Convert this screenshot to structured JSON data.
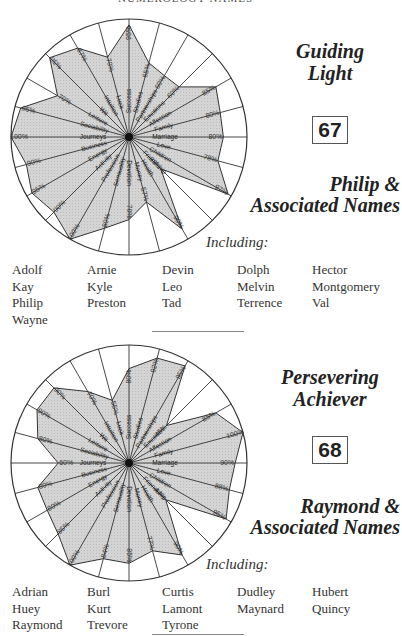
{
  "page": {
    "cropped_header": "NUMEROLOGY NAMES"
  },
  "sections": [
    {
      "title_line1": "Guiding",
      "title_line2": "Light",
      "number": "67",
      "name_line1": "Philip &",
      "name_line2": "Associated Names",
      "including_label": "Including:",
      "names": [
        "Adolf",
        "Arnie",
        "Devin",
        "Dolph",
        "Hector",
        "Kay",
        "Kyle",
        "Leo",
        "Melvin",
        "Montgomery",
        "Philip",
        "Preston",
        "Tad",
        "Terrence",
        "Val",
        "Wayne"
      ]
    },
    {
      "title_line1": "Persevering",
      "title_line2": "Achiever",
      "number": "68",
      "name_line1": "Raymond &",
      "name_line2": "Associated Names",
      "including_label": "Including:",
      "names": [
        "Adrian",
        "Burl",
        "Curtis",
        "Dudley",
        "Hubert",
        "Huey",
        "Kurt",
        "Lamont",
        "Maynard",
        "Quincy",
        "Raymond",
        "Trevore",
        "Tyrone"
      ]
    }
  ],
  "chart_data": [
    {
      "type": "radar",
      "title": "Guiding Light (67)",
      "categories": [
        "Success",
        "Studies",
        "Partnerships",
        "Emotions",
        "Affection",
        "Family",
        "Marriage",
        "Love",
        "Children",
        "Friendship",
        "Health",
        "Money",
        "Devotion",
        "Sensuality",
        "Profession",
        "Activity",
        "Energy",
        "Business",
        "Journeys",
        "Sociability",
        "Leisure",
        "Wit",
        "Intuition",
        "Luck"
      ],
      "values": [
        95,
        65,
        60,
        60,
        85,
        80,
        80,
        78,
        97,
        38,
        90,
        57,
        70,
        80,
        100,
        90,
        95,
        90,
        100,
        95,
        70,
        95,
        87,
        70
      ],
      "labels": [
        "95%",
        "65%",
        "60%",
        "60%",
        "85%",
        "80%",
        "80%",
        "78%",
        "97%",
        "38%",
        "90%",
        "57%",
        "70%",
        "80%",
        "100%",
        "90%",
        "95%",
        "90%",
        "100%",
        "95%",
        "70%",
        "95%",
        "87%",
        "70%"
      ],
      "range": [
        0,
        100
      ]
    },
    {
      "type": "radar",
      "title": "Persevering Achiever (68)",
      "categories": [
        "Success",
        "Studies",
        "Partnerships",
        "Emotions",
        "Affection",
        "Family",
        "Marriage",
        "Love",
        "Children",
        "Friendship",
        "Health",
        "Money",
        "Devotion",
        "Sensuality",
        "Profession",
        "Activity",
        "Energy",
        "Business",
        "Journeys",
        "Sociability",
        "Leisure",
        "Wit",
        "Intuition",
        "Luck"
      ],
      "values": [
        80,
        92,
        95,
        45,
        85,
        100,
        90,
        88,
        95,
        44,
        90,
        77,
        85,
        84,
        100,
        85,
        80,
        80,
        60,
        80,
        90,
        90,
        70,
        55
      ],
      "labels": [
        "80%",
        "92%",
        "95%",
        "45%",
        "85%",
        "100%",
        "90%",
        "88%",
        "95%",
        "44%",
        "90%",
        "77%",
        "85%",
        "84%",
        "100%",
        "85%",
        "80%",
        "80%",
        "60%",
        "80%",
        "90%",
        "90%",
        "70%",
        "55%"
      ],
      "range": [
        0,
        100
      ]
    }
  ]
}
